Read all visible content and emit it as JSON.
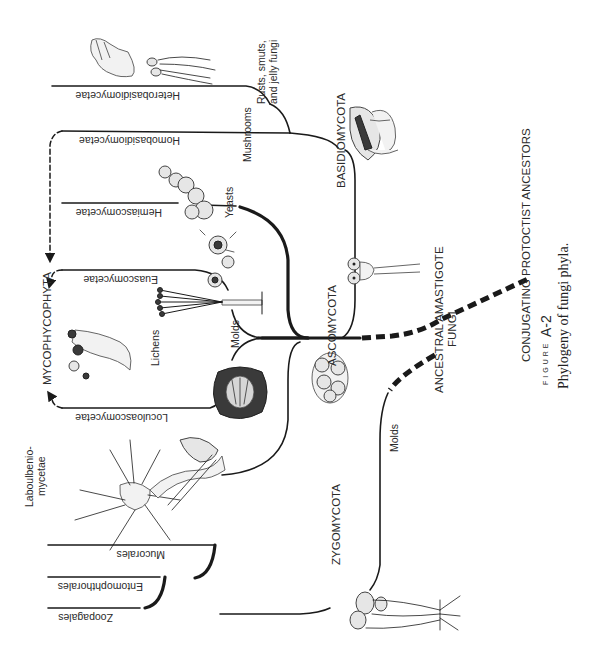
{
  "figure": {
    "label_prefix": "FIGURE",
    "number": "A-2",
    "caption": "Phylogeny of fungi phyla."
  },
  "phyla": {
    "basidiomycota": "BASIDIOMYCOTA",
    "ascomycota": "ASCOMYCOTA",
    "zygomycota": "ZYGOMYCOTA",
    "mycophycophyta": "MYCOPHYCOPHYTA"
  },
  "ancestors": {
    "ancestral_amastigote_line1": "ANCESTRAL AMASTIGOTE",
    "ancestral_amastigote_line2": "FUNGI",
    "conjugating": "CONJUGATING PROTOCTIST ANCESTORS"
  },
  "classes": {
    "heterobasidiomycetae": "Heterobasidiomycetae",
    "homobasidiomycetae": "Homobasidiomycetae",
    "hemiascomycetae": "Hemiascomycetae",
    "euascomycetae": "Euascomycetae",
    "loculoascomycetae": "Loculoascomycetae",
    "laboulbeniomycetae_line1": "Laboulbenio-",
    "laboulbeniomycetae_line2": "mycetae",
    "mucorales": "Mucorales",
    "entomophthorales": "Entomophthorales",
    "zoopagales": "Zoopagales"
  },
  "common_names": {
    "rusts_line1": "Rusts, smuts,",
    "rusts_line2": "and jelly fungi",
    "mushrooms": "Mushrooms",
    "yeasts": "Yeasts",
    "molds_asco": "Molds",
    "lichens": "Lichens",
    "molds_zygo": "Molds"
  },
  "colors": {
    "ink": "#1a1a1a",
    "background": "#ffffff"
  }
}
